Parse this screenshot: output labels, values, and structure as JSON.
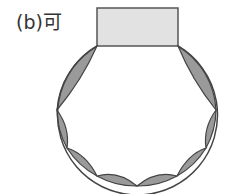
{
  "figure": {
    "label": "(b)可",
    "colors": {
      "rect_fill": "#e2e2e2",
      "rect_stroke": "#555555",
      "lens_fill": "#9a9a9a",
      "outline": "#444444",
      "background": "#ffffff"
    },
    "rectangle": {
      "x": 97,
      "y": 8,
      "width": 81,
      "height": 38
    },
    "circle": {
      "cx": 136.5,
      "cy": 107,
      "r": 80
    },
    "vertices": [
      [
        97,
        46
      ],
      [
        57,
        110
      ],
      [
        67,
        148
      ],
      [
        97,
        176
      ],
      [
        137,
        186
      ],
      [
        177,
        176
      ],
      [
        206,
        148
      ],
      [
        216,
        110
      ],
      [
        178,
        46
      ]
    ]
  }
}
